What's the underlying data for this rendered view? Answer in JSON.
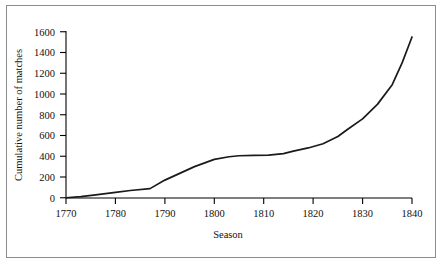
{
  "chart_data": {
    "type": "line",
    "title": "",
    "xlabel": "Season",
    "ylabel": "Cumulative number of matches",
    "xlim": [
      1770,
      1840
    ],
    "ylim": [
      0,
      1600
    ],
    "grid": false,
    "legend": null,
    "x_ticks": [
      1770,
      1780,
      1790,
      1800,
      1810,
      1820,
      1830,
      1840
    ],
    "y_ticks": [
      0,
      200,
      400,
      600,
      800,
      1000,
      1200,
      1400,
      1600
    ],
    "line_color": "#1a1a1a",
    "series": [
      {
        "name": "Cumulative number of matches",
        "x": [
          1770,
          1773,
          1776,
          1780,
          1783,
          1787,
          1790,
          1793,
          1796,
          1800,
          1803,
          1805,
          1808,
          1811,
          1814,
          1816,
          1819,
          1822,
          1825,
          1827,
          1830,
          1833,
          1836,
          1838,
          1840
        ],
        "values": [
          0,
          10,
          28,
          52,
          70,
          88,
          170,
          235,
          300,
          370,
          395,
          405,
          408,
          410,
          425,
          450,
          480,
          520,
          590,
          660,
          760,
          900,
          1090,
          1300,
          1550
        ]
      }
    ]
  },
  "axis": {
    "y_title": "Cumulative number of matches",
    "x_title": "Season",
    "y_tick_labels": [
      "1600",
      "1400",
      "1200",
      "1000",
      "800",
      "600",
      "400",
      "200",
      "0"
    ],
    "x_tick_labels": [
      "1770",
      "1780",
      "1790",
      "1800",
      "1810",
      "1820",
      "1830",
      "1840"
    ]
  }
}
